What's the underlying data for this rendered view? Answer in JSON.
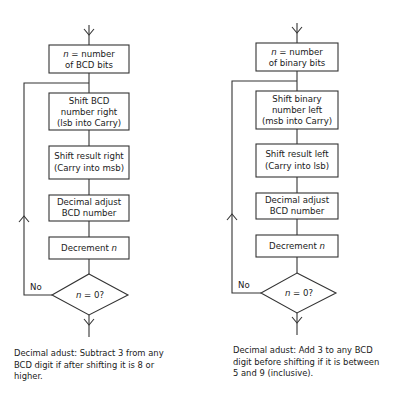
{
  "flowcharts": [
    {
      "id": "bcd-to-binary",
      "steps": [
        {
          "italic_prefix": "n",
          "text": " = number",
          "line2": "of BCD bits"
        },
        {
          "line1": "Shift BCD",
          "line2": "number right",
          "line3": "(lsb into Carry)"
        },
        {
          "line1": "Shift result right",
          "line2": "(Carry into msb)"
        },
        {
          "line1": "Decimal adjust",
          "line2": "BCD number"
        },
        {
          "text": "Decrement ",
          "italic_suffix": "n"
        }
      ],
      "decision": {
        "italic_prefix": "n",
        "text": " = 0?",
        "no_label": "No"
      },
      "note": "Decimal adust: Subtract 3 from any BCD digit if after shifting it is 8 or higher."
    },
    {
      "id": "binary-to-bcd",
      "steps": [
        {
          "italic_prefix": "n",
          "text": " = number",
          "line2": "of binary bits"
        },
        {
          "line1": "Shift binary",
          "line2": "number left",
          "line3": "(msb into Carry)"
        },
        {
          "line1": "Shift result left",
          "line2": "(Carry into lsb)"
        },
        {
          "line1": "Decimal adjust",
          "line2": "BCD number"
        },
        {
          "text": "Decrement ",
          "italic_suffix": "n"
        }
      ],
      "decision": {
        "italic_prefix": "n",
        "text": " = 0?",
        "no_label": "No"
      },
      "note": "Decimal adust: Add 3 to any BCD digit before shifting if it is between 5 and 9 (inclusive)."
    }
  ]
}
